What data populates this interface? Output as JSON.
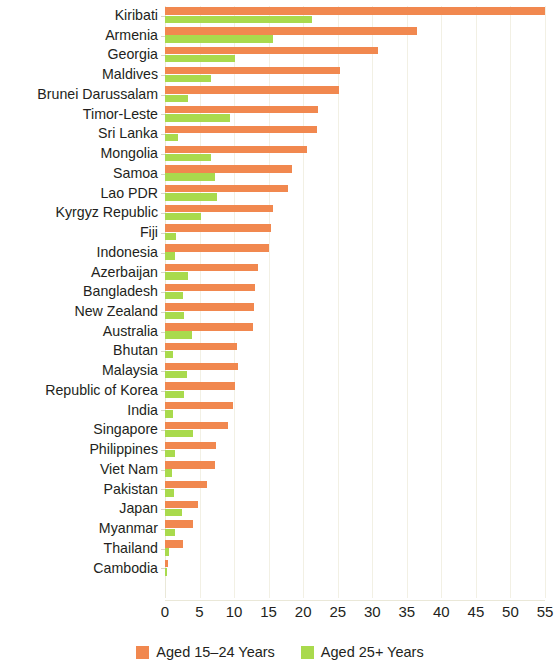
{
  "chart_data": {
    "type": "bar",
    "orientation": "horizontal",
    "title": "",
    "subtitle": "",
    "xlabel": "",
    "ylabel": "",
    "xlim": [
      0,
      55
    ],
    "xticks": [
      0,
      5,
      10,
      15,
      20,
      25,
      30,
      35,
      40,
      45,
      50,
      55
    ],
    "grid": true,
    "grid_axis": "x",
    "legend_position": "bottom-center",
    "categories": [
      "Kiribati",
      "Armenia",
      "Georgia",
      "Maldives",
      "Brunei Darussalam",
      "Timor-Leste",
      "Sri Lanka",
      "Mongolia",
      "Samoa",
      "Lao PDR",
      "Kyrgyz Republic",
      "Fiji",
      "Indonesia",
      "Azerbaijan",
      "Bangladesh",
      "New Zealand",
      "Australia",
      "Bhutan",
      "Malaysia",
      "Republic of Korea",
      "India",
      "Singapore",
      "Philippines",
      "Viet Nam",
      "Pakistan",
      "Japan",
      "Myanmar",
      "Thailand",
      "Cambodia"
    ],
    "series": [
      {
        "name": "Aged 15-24 Years",
        "color": "#f1884f",
        "values": [
          55.0,
          36.5,
          30.8,
          25.4,
          25.2,
          22.2,
          22.0,
          20.6,
          18.4,
          17.8,
          15.6,
          15.4,
          15.1,
          13.5,
          13.0,
          12.9,
          12.7,
          10.4,
          10.5,
          10.1,
          9.8,
          9.1,
          7.4,
          7.2,
          6.1,
          4.8,
          4.0,
          2.6,
          0.4
        ]
      },
      {
        "name": "Aged 25+ Years",
        "color": "#a9da4d",
        "values": [
          21.3,
          15.6,
          10.1,
          6.6,
          3.4,
          9.4,
          1.9,
          6.6,
          7.2,
          7.5,
          5.2,
          1.6,
          1.5,
          3.4,
          2.6,
          2.7,
          3.9,
          1.2,
          3.2,
          2.7,
          1.1,
          4.0,
          1.4,
          1.0,
          1.3,
          2.5,
          1.5,
          0.6,
          0.3
        ]
      }
    ]
  },
  "legend": {
    "items": [
      {
        "label": "Aged 15–24 Years",
        "color": "#f1884f",
        "swatch_name": "legend-swatch-young"
      },
      {
        "label": "Aged 25+ Years",
        "color": "#a9da4d",
        "swatch_name": "legend-swatch-older"
      }
    ]
  }
}
